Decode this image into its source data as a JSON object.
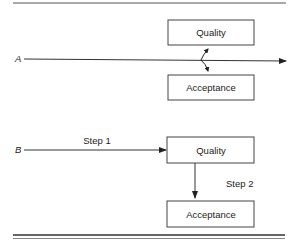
{
  "diagram": {
    "scenario_a": {
      "label": "A",
      "top_box": "Quality",
      "bottom_box": "Acceptance"
    },
    "scenario_b": {
      "label": "B",
      "step1_label": "Step 1",
      "step2_label": "Step 2",
      "top_box": "Quality",
      "bottom_box": "Acceptance"
    },
    "colors": {
      "line": "#333333",
      "background": "#ffffff"
    }
  }
}
